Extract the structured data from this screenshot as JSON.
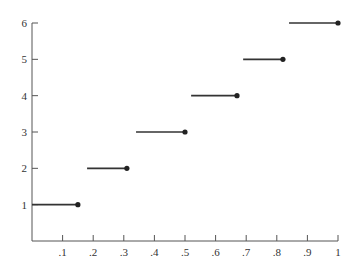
{
  "chart_data": {
    "type": "line",
    "subtype": "step-function",
    "title": "",
    "xlabel": "",
    "ylabel": "",
    "xlim": [
      0,
      1
    ],
    "ylim": [
      0,
      6
    ],
    "x_ticks": [
      ".1",
      ".2",
      ".3",
      ".4",
      ".5",
      ".6",
      ".7",
      ".8",
      ".9",
      "1"
    ],
    "x_tick_values": [
      0.1,
      0.2,
      0.3,
      0.4,
      0.5,
      0.6,
      0.7,
      0.8,
      0.9,
      1.0
    ],
    "y_ticks": [
      "1",
      "2",
      "3",
      "4",
      "5",
      "6"
    ],
    "y_tick_values": [
      1,
      2,
      3,
      4,
      5,
      6
    ],
    "grid": false,
    "legend": null,
    "segments": [
      {
        "y": 1,
        "x_start": 0.0,
        "x_end": 0.15,
        "closed_end": "right"
      },
      {
        "y": 2,
        "x_start": 0.18,
        "x_end": 0.31,
        "closed_end": "right"
      },
      {
        "y": 3,
        "x_start": 0.34,
        "x_end": 0.5,
        "closed_end": "right"
      },
      {
        "y": 4,
        "x_start": 0.52,
        "x_end": 0.67,
        "closed_end": "right"
      },
      {
        "y": 5,
        "x_start": 0.69,
        "x_end": 0.82,
        "closed_end": "right"
      },
      {
        "y": 6,
        "x_start": 0.84,
        "x_end": 1.0,
        "closed_end": "right"
      }
    ],
    "colors": {
      "line": "#333333",
      "axis": "#555555",
      "dot": "#222222"
    }
  }
}
